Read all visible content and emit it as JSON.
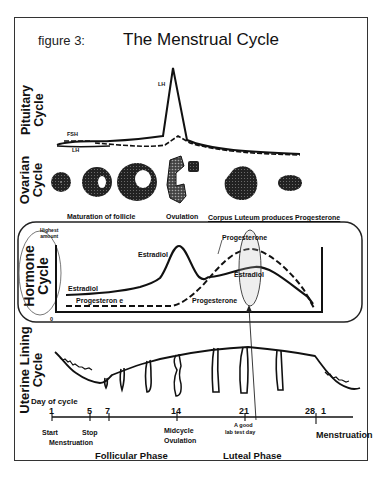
{
  "figure": {
    "label": "figure 3:",
    "title": "The Menstrual Cycle"
  },
  "sections": {
    "pituitary": {
      "line1": "Pituitary",
      "line2": "Cycle",
      "curve_labels": {
        "lh_peak": "LH",
        "fsh": "FSH",
        "lh_low": "LH"
      }
    },
    "ovarian": {
      "line1": "Ovarian",
      "line2": "Cycle",
      "captions": [
        "Maturation of follicle",
        "Ovulation",
        "Corpus Luteum produces Progesterone"
      ]
    },
    "hormone": {
      "line1": "Hormone",
      "line2": "Cycle",
      "y_top_label_1": "Highest",
      "y_top_label_2": "amount",
      "y_zero_label": "0",
      "curve_labels": {
        "estradiol_peak": "Estradiol",
        "estradiol_start": "Estradiol",
        "progesterone_start": "Progesteron e",
        "progesterone_rise": "Progesterone",
        "progesterone_peak": "Progesterone",
        "estradiol_luteal": "Estradiol"
      }
    },
    "uterine": {
      "line1": "Uterine Lining",
      "line2": "Cycle",
      "day_label": "Day of cycle"
    }
  },
  "timeline": {
    "ticks": [
      {
        "day": "1"
      },
      {
        "day": "5"
      },
      {
        "day": "7"
      },
      {
        "day": "14"
      },
      {
        "day": "21"
      },
      {
        "day": "28"
      },
      {
        "day": "1"
      }
    ],
    "annotations": {
      "start": "Start",
      "stop": "Stop",
      "menstruation_1": "Menstruation",
      "midcycle": "Midcycle",
      "ovulation": "Ovulation",
      "lab_test_1": "A good",
      "lab_test_2": "lab test day",
      "menstruation_2": "Menstruation"
    },
    "phases": {
      "follicular": "Follicular Phase",
      "luteal": "Luteal Phase"
    }
  },
  "colors": {
    "ink": "#111111",
    "frame": "#333333",
    "background": "#ffffff"
  }
}
